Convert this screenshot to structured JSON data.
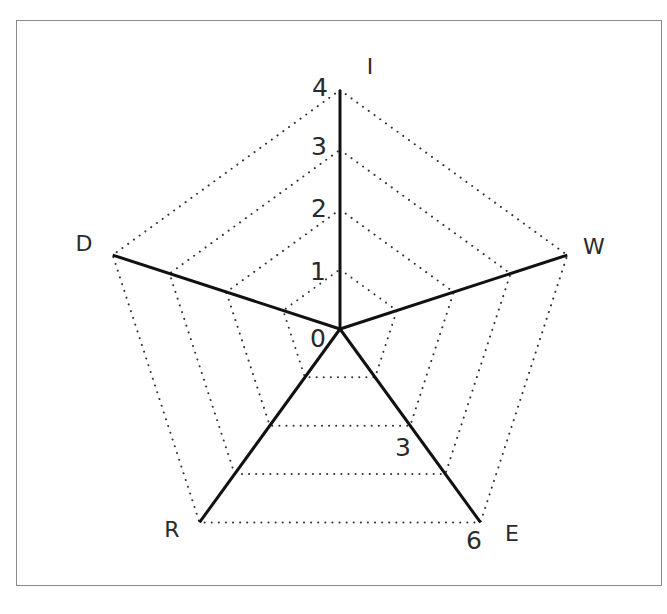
{
  "chart_data": {
    "type": "radar",
    "title": "",
    "axes": [
      {
        "name": "I",
        "min": 0,
        "max": 4,
        "tick_labels": [
          "0",
          "1",
          "2",
          "3",
          "4"
        ]
      },
      {
        "name": "W",
        "min": 0,
        "max": 4,
        "tick_labels": []
      },
      {
        "name": "E",
        "min": 0,
        "max": 6,
        "tick_labels": [
          "3",
          "6"
        ]
      },
      {
        "name": "R",
        "min": 0,
        "max": 4,
        "tick_labels": []
      },
      {
        "name": "D",
        "min": 0,
        "max": 4,
        "tick_labels": []
      }
    ],
    "rings": 4,
    "grid": "dotted pentagons",
    "series": [
      {
        "name": "axes",
        "values": [
          4,
          4,
          6,
          4,
          4
        ],
        "note": "solid spokes drawn from center to outer ring on every axis"
      }
    ]
  },
  "labels": {
    "axis_I": "I",
    "axis_W": "W",
    "axis_E": "E",
    "axis_R": "R",
    "axis_D": "D",
    "tick_0": "0",
    "tick_1": "1",
    "tick_2": "2",
    "tick_3": "3",
    "tick_4": "4",
    "tick_E_mid": "3",
    "tick_E_max": "6"
  },
  "colors": {
    "spoke": "#111111",
    "grid": "#333333",
    "text": "#2a2a2a",
    "frame": "#8a8a8a"
  }
}
